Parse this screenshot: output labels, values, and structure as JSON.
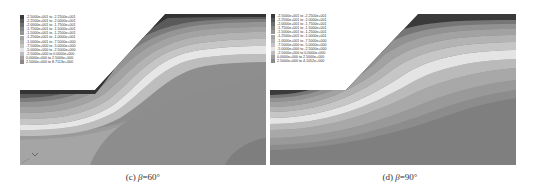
{
  "figure": {
    "panels": [
      {
        "id": "c",
        "caption_prefix": "(c) ",
        "caption_symbol": "β",
        "caption_suffix": "=60°",
        "legend": [
          {
            "range": "-2.5000e+001 to -2.2500e+001",
            "color": "#3a3a3a"
          },
          {
            "range": "-2.2500e+001 to -2.0000e+001",
            "color": "#565656"
          },
          {
            "range": "-2.0000e+001 to -1.7500e+001",
            "color": "#6e6e6e"
          },
          {
            "range": "-1.7500e+001 to -1.5000e+001",
            "color": "#848484"
          },
          {
            "range": "-1.5000e+001 to -1.2500e+001",
            "color": "#959595"
          },
          {
            "range": "-1.2500e+001 to -1.0000e+001",
            "color": "#a3a3a3"
          },
          {
            "range": "-1.0000e+001 to -7.5000e+000",
            "color": "#b2b2b2"
          },
          {
            "range": "-7.5000e+000 to -5.0000e+000",
            "color": "#c4c4c4"
          },
          {
            "range": "-5.0000e+000 to -2.5000e+000",
            "color": "#e6e6e6"
          },
          {
            "range": "-2.5000e+000 to 0.0000e+000",
            "color": "#bdbdbd"
          },
          {
            "range": "0.0000e+000 to 2.5000e+000",
            "color": "#9f9f9f"
          },
          {
            "range": "2.5000e+000 to 8.7113e+000",
            "color": "#8a8a8a"
          }
        ]
      },
      {
        "id": "d",
        "caption_prefix": "(d) ",
        "caption_symbol": "β",
        "caption_suffix": "=90°",
        "legend": [
          {
            "range": "-2.5000e+001 to -2.2500e+001",
            "color": "#3a3a3a"
          },
          {
            "range": "-2.2500e+001 to -2.0000e+001",
            "color": "#565656"
          },
          {
            "range": "-2.0000e+001 to -1.7500e+001",
            "color": "#6e6e6e"
          },
          {
            "range": "-1.7500e+001 to -1.5000e+001",
            "color": "#848484"
          },
          {
            "range": "-1.5000e+001 to -1.2500e+001",
            "color": "#959595"
          },
          {
            "range": "-1.2500e+001 to -1.0000e+001",
            "color": "#a3a3a3"
          },
          {
            "range": "-1.0000e+001 to -7.5000e+000",
            "color": "#b2b2b2"
          },
          {
            "range": "-7.5000e+000 to -5.0000e+000",
            "color": "#c4c4c4"
          },
          {
            "range": "-5.0000e+000 to -2.5000e+000",
            "color": "#e6e6e6"
          },
          {
            "range": "-2.5000e+000 to 0.0000e+000",
            "color": "#bdbdbd"
          },
          {
            "range": "0.0000e+000 to 2.5000e+000",
            "color": "#9f9f9f"
          },
          {
            "range": "2.5000e+000 to 4.1052e+000",
            "color": "#8a8a8a"
          }
        ]
      }
    ]
  }
}
